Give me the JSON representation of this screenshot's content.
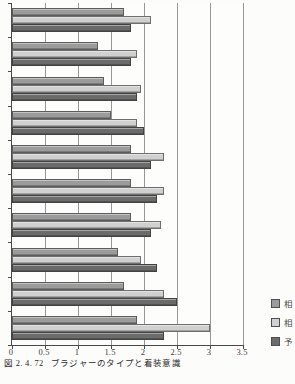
{
  "figure": {
    "caption_number": "図 2. 4. 72",
    "caption_title": "ブラジャーのタイプと着装意識"
  },
  "chart_data": {
    "type": "bar",
    "orientation": "horizontal",
    "title": "ブラジャーのタイプと着装意識",
    "xlabel": "",
    "ylabel": "",
    "xlim": [
      0,
      3.5
    ],
    "x_ticks": [
      "0",
      "0.5",
      "1",
      "1.5",
      "2",
      "2.5",
      "3",
      "3.5"
    ],
    "grid": true,
    "legend_position": "right",
    "n_groups": 10,
    "categories": [
      "",
      "",
      "",
      "",
      "",
      "",
      "",
      "",
      "",
      ""
    ],
    "series": [
      {
        "name": "相",
        "color": "#9b9b9b",
        "border": "#5c5c5c",
        "values": [
          1.7,
          1.3,
          1.4,
          1.5,
          1.8,
          1.8,
          1.8,
          1.6,
          1.7,
          1.9
        ]
      },
      {
        "name": "相",
        "color": "#d0d0d0",
        "border": "#6e6e6e",
        "values": [
          2.1,
          1.9,
          1.95,
          1.9,
          2.3,
          2.3,
          2.25,
          1.95,
          2.3,
          3.0
        ]
      },
      {
        "name": "予",
        "color": "#6b6b6b",
        "border": "#424242",
        "values": [
          1.8,
          1.8,
          1.9,
          2.0,
          2.1,
          2.2,
          2.1,
          2.2,
          2.5,
          2.3
        ]
      }
    ]
  },
  "legend": {
    "items": [
      {
        "label": "相",
        "clipped": true,
        "swatch_color": "#9b9b9b"
      },
      {
        "label": "相",
        "clipped": true,
        "swatch_color": "#d0d0d0"
      },
      {
        "label": "予",
        "clipped": true,
        "swatch_color": "#6b6b6b"
      }
    ]
  },
  "colors": {
    "background": "#fcfcfb",
    "axis": "#4a4a4a",
    "gridline": "#979797",
    "caption_text": "#2d2d2d"
  }
}
